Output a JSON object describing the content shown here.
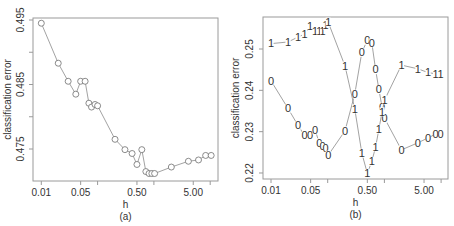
{
  "chart_data": [
    {
      "type": "line",
      "panel_label": "(a)",
      "xlabel": "h",
      "ylabel": "classification error",
      "x_scale": "log",
      "xlim": [
        0.01,
        10.5
      ],
      "ylim": [
        0.4705,
        0.495
      ],
      "x_ticks": [
        0.01,
        0.05,
        0.1,
        0.5,
        1,
        5,
        10
      ],
      "x_tick_labels": {
        "0.01": "0.01",
        "0.05": "0.05",
        "0.5": "0.50",
        "5": "5.00"
      },
      "y_ticks": [
        0.495,
        0.49,
        0.485,
        0.48,
        0.475
      ],
      "y_tick_labels": {
        "0.495": "0.495",
        "0.485": "0.485",
        "0.475": "0.475"
      },
      "grid": false,
      "marker": "circle",
      "series": [
        {
          "name": "error",
          "x": [
            0.01,
            0.02,
            0.03,
            0.041,
            0.05,
            0.06,
            0.07,
            0.078,
            0.09,
            0.1,
            0.204,
            0.306,
            0.41,
            0.5,
            0.61,
            0.72,
            0.82,
            0.92,
            1.03,
            2.04,
            4.1,
            6.2,
            8.3,
            10.4
          ],
          "values": [
            0.4945,
            0.4883,
            0.4855,
            0.4835,
            0.4855,
            0.4855,
            0.4821,
            0.4815,
            0.4819,
            0.4817,
            0.4765,
            0.4749,
            0.4743,
            0.4726,
            0.4749,
            0.4715,
            0.4712,
            0.4712,
            0.4712,
            0.4722,
            0.4731,
            0.4733,
            0.474,
            0.474
          ]
        }
      ]
    },
    {
      "type": "line",
      "panel_label": "(b)",
      "xlabel": "h",
      "ylabel": "classification error",
      "x_scale": "log",
      "xlim": [
        0.01,
        10.5
      ],
      "ylim": [
        0.2185,
        0.2575
      ],
      "x_ticks": [
        0.01,
        0.05,
        0.1,
        0.5,
        1,
        5,
        10
      ],
      "x_tick_labels": {
        "0.01": "0.01",
        "0.05": "0.05",
        "0.5": "0.50",
        "5": "5.00"
      },
      "y_ticks": [
        0.25,
        0.24,
        0.23,
        0.22
      ],
      "y_tick_labels": {
        "0.25": "0.25",
        "0.24": "0.24",
        "0.23": "0.23",
        "0.22": "0.22"
      },
      "grid": false,
      "marker": "text-symbol",
      "series": [
        {
          "name": "0",
          "symbol": "0",
          "x": [
            0.01,
            0.02,
            0.03,
            0.039,
            0.049,
            0.06,
            0.071,
            0.081,
            0.092,
            0.102,
            0.202,
            0.3,
            0.4,
            0.5,
            0.6,
            0.7,
            0.8,
            0.91,
            1.01,
            2.0,
            3.9,
            5.9,
            8.0,
            9.8
          ],
          "values": [
            0.2423,
            0.2356,
            0.2315,
            0.2291,
            0.2291,
            0.2304,
            0.2273,
            0.2265,
            0.2259,
            0.2243,
            0.2302,
            0.2391,
            0.2492,
            0.2521,
            0.2515,
            0.245,
            0.2402,
            0.2359,
            0.2332,
            0.2256,
            0.2273,
            0.2285,
            0.2294,
            0.2294
          ]
        },
        {
          "name": "1",
          "symbol": "1",
          "x": [
            0.01,
            0.02,
            0.03,
            0.039,
            0.049,
            0.06,
            0.071,
            0.081,
            0.092,
            0.102,
            0.202,
            0.3,
            0.4,
            0.5,
            0.6,
            0.7,
            0.8,
            0.91,
            1.01,
            2.0,
            3.9,
            5.9,
            8.0,
            9.8
          ],
          "values": [
            0.2513,
            0.2517,
            0.2529,
            0.2536,
            0.2555,
            0.2542,
            0.2542,
            0.2542,
            0.2558,
            0.2565,
            0.2459,
            0.2355,
            0.2248,
            0.2199,
            0.2228,
            0.2263,
            0.2306,
            0.2348,
            0.2377,
            0.2461,
            0.2452,
            0.2443,
            0.244,
            0.244
          ]
        }
      ]
    }
  ],
  "panels": {
    "a": {
      "label": "(a)",
      "xlabel": "h",
      "ylabel": "classification error"
    },
    "b": {
      "label": "(b)",
      "xlabel": "h",
      "ylabel": "classification error"
    }
  },
  "style": {
    "line_color": "#8a8a8a",
    "marker_color": "#6f6f6f",
    "axis_color": "#9a9a9a",
    "text_color": "#333333"
  }
}
